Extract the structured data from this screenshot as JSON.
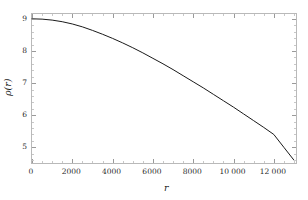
{
  "chart_data": {
    "type": "line",
    "title": "",
    "xlabel": "r",
    "ylabel": "ρ(r)",
    "xlim": [
      0,
      13200
    ],
    "ylim": [
      4.45,
      9.15
    ],
    "xticks": [
      0,
      2000,
      4000,
      6000,
      8000,
      10000,
      12000
    ],
    "xticklabels": [
      "0",
      "2000",
      "4000",
      "6000",
      "8000",
      "10 000",
      "12 000"
    ],
    "yticks": [
      5,
      6,
      7,
      8,
      9
    ],
    "yticklabels": [
      "5",
      "6",
      "7",
      "8",
      "9"
    ],
    "grid": false,
    "legend": null,
    "series": [
      {
        "name": "ρ(r)",
        "color": "#1a1a1a",
        "linewidth": 1.0,
        "x": [
          0,
          500,
          1000,
          1500,
          2000,
          2500,
          3000,
          3500,
          4000,
          4500,
          5000,
          5500,
          6000,
          6500,
          7000,
          7500,
          8000,
          8500,
          9000,
          9500,
          10000,
          10500,
          11000,
          11500,
          12000,
          12500,
          13000
        ],
        "y": [
          9.0,
          8.99,
          8.96,
          8.91,
          8.84,
          8.75,
          8.64,
          8.52,
          8.39,
          8.25,
          8.1,
          7.94,
          7.77,
          7.6,
          7.42,
          7.23,
          7.04,
          6.85,
          6.65,
          6.45,
          6.25,
          6.04,
          5.83,
          5.62,
          5.4,
          5.0,
          4.6
        ]
      }
    ]
  },
  "axes": {
    "x_title": "r",
    "y_title": "ρ(r)"
  },
  "style": {
    "frame_color": "#b9b9b9",
    "tick_color": "#9a9a9a",
    "curve_color": "#1a1a1a",
    "background": "#ffffff",
    "label_color": "#2b2b2b"
  }
}
